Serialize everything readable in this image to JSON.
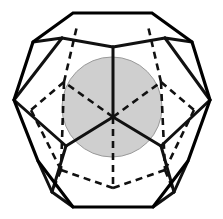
{
  "figure": {
    "type": "geometric-solid-diagram",
    "solid_name": "regular dodecahedron",
    "inscribed_shape": "sphere",
    "projection": "orthographic, viewed down a 3-fold (vertex-first) axis",
    "canvas": {
      "width": 223,
      "height": 219,
      "background": "#ffffff"
    }
  },
  "style": {
    "outline_color": "#000000",
    "outline_width": 3.2,
    "visible_edge_color": "#111111",
    "visible_edge_width": 3.0,
    "hidden_edge_color": "#111111",
    "hidden_edge_width": 2.6,
    "hidden_edge_dash": "7,5",
    "sphere_fill": "#cfcfcf",
    "sphere_stroke": "#9a9a9a",
    "sphere_stroke_width": 1.0
  },
  "sphere": {
    "label": "inscribed sphere",
    "center_x": 112,
    "center_y": 107,
    "radius": 50,
    "fill": "#cfcfcf"
  },
  "outer_silhouette": {
    "label": "decagonal silhouette",
    "points": "73,13 152,13 192,42 210,100 188,161 153,207 73,207 38,161 14,100 33,42"
  },
  "visible_edges": [
    {
      "name": "front-top-hub-vertical",
      "from_x": 113,
      "from_y": 117,
      "to_x": 113,
      "to_y": 47
    },
    {
      "name": "hub-to-lower-left",
      "from_x": 113,
      "from_y": 117,
      "to_x": 66,
      "to_y": 146
    },
    {
      "name": "hub-to-lower-right",
      "from_x": 113,
      "from_y": 117,
      "to_x": 161,
      "to_y": 146
    },
    {
      "name": "upper-ridge-left",
      "from_x": 113,
      "from_y": 47,
      "to_x": 62,
      "to_y": 38
    },
    {
      "name": "upper-ridge-right",
      "from_x": 113,
      "from_y": 47,
      "to_x": 165,
      "to_y": 38
    },
    {
      "name": "ridge-left-to-silhouette",
      "from_x": 62,
      "from_y": 38,
      "to_x": 33,
      "to_y": 42
    },
    {
      "name": "ridge-right-to-silhouette",
      "from_x": 165,
      "from_y": 38,
      "to_x": 192,
      "to_y": 42
    },
    {
      "name": "left-face-upper",
      "from_x": 62,
      "from_y": 38,
      "to_x": 14,
      "to_y": 100
    },
    {
      "name": "right-face-upper",
      "from_x": 165,
      "from_y": 38,
      "to_x": 210,
      "to_y": 100
    },
    {
      "name": "left-hub-down",
      "from_x": 66,
      "from_y": 146,
      "to_x": 14,
      "to_y": 100
    },
    {
      "name": "right-hub-down",
      "from_x": 161,
      "from_y": 146,
      "to_x": 210,
      "to_y": 100
    },
    {
      "name": "lower-left-strut",
      "from_x": 66,
      "from_y": 146,
      "to_x": 52,
      "to_y": 192
    },
    {
      "name": "lower-right-strut",
      "from_x": 161,
      "from_y": 146,
      "to_x": 174,
      "to_y": 192
    },
    {
      "name": "lower-left-to-bottom",
      "from_x": 52,
      "from_y": 192,
      "to_x": 73,
      "to_y": 207
    },
    {
      "name": "lower-right-to-bottom",
      "from_x": 174,
      "from_y": 192,
      "to_x": 153,
      "to_y": 207
    },
    {
      "name": "lower-left-to-silhouette",
      "from_x": 52,
      "from_y": 192,
      "to_x": 38,
      "to_y": 161
    },
    {
      "name": "lower-right-to-silhouette",
      "from_x": 174,
      "from_y": 192,
      "to_x": 188,
      "to_y": 161
    }
  ],
  "hidden_edges": [
    {
      "name": "back-hub-vertical-down",
      "from_x": 113,
      "from_y": 117,
      "to_x": 113,
      "to_y": 188
    },
    {
      "name": "back-hub-upper-left",
      "from_x": 113,
      "from_y": 117,
      "to_x": 64,
      "to_y": 82
    },
    {
      "name": "back-hub-upper-right",
      "from_x": 113,
      "from_y": 117,
      "to_x": 161,
      "to_y": 82
    },
    {
      "name": "back-upper-left-to-top",
      "from_x": 64,
      "from_y": 82,
      "to_x": 77,
      "to_y": 26
    },
    {
      "name": "back-upper-right-to-top",
      "from_x": 161,
      "from_y": 82,
      "to_x": 148,
      "to_y": 26
    },
    {
      "name": "back-upper-left-to-silhouette",
      "from_x": 64,
      "from_y": 82,
      "to_x": 31,
      "to_y": 110
    },
    {
      "name": "back-upper-right-to-silhouette",
      "from_x": 161,
      "from_y": 82,
      "to_x": 194,
      "to_y": 110
    },
    {
      "name": "back-bottom-left",
      "from_x": 113,
      "from_y": 188,
      "to_x": 61,
      "to_y": 170
    },
    {
      "name": "back-bottom-right",
      "from_x": 113,
      "from_y": 188,
      "to_x": 165,
      "to_y": 170
    },
    {
      "name": "back-bottom-left-to-silhouette",
      "from_x": 61,
      "from_y": 170,
      "to_x": 31,
      "to_y": 110
    },
    {
      "name": "back-bottom-right-to-silhouette",
      "from_x": 165,
      "from_y": 170,
      "to_x": 194,
      "to_y": 110
    },
    {
      "name": "back-left-vertical",
      "from_x": 31,
      "from_y": 110,
      "to_x": 31,
      "to_y": 110
    },
    {
      "name": "back-bottom-left-strut",
      "from_x": 61,
      "from_y": 170,
      "to_x": 52,
      "to_y": 192
    },
    {
      "name": "back-bottom-right-strut",
      "from_x": 165,
      "from_y": 170,
      "to_x": 174,
      "to_y": 192
    }
  ],
  "hidden_vertical_edges": [
    {
      "name": "left-back-vertical",
      "from_x": 64,
      "from_y": 82,
      "to_x": 61,
      "to_y": 170
    },
    {
      "name": "right-back-vertical",
      "from_x": 161,
      "from_y": 82,
      "to_x": 165,
      "to_y": 170
    }
  ]
}
